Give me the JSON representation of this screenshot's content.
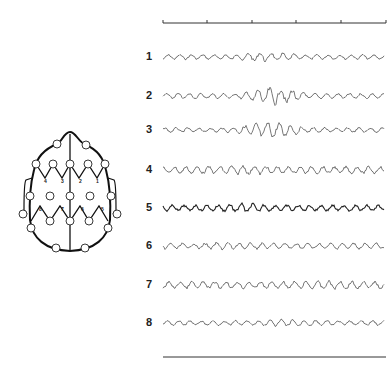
{
  "figure": {
    "type": "EEG recording diagram",
    "time_bar": {
      "x_start": 163,
      "x_end": 386,
      "y": 23,
      "ticks_x": [
        163,
        207,
        252,
        296,
        341,
        386
      ]
    },
    "bottom_bar": {
      "x_start": 163,
      "x_end": 386,
      "y": 357
    },
    "channels": [
      {
        "label": "1",
        "y": 57,
        "amp": 2.0,
        "burst": [
          230,
          300
        ],
        "burst_amp": 4.0
      },
      {
        "label": "2",
        "y": 96,
        "amp": 2.2,
        "burst": [
          240,
          310
        ],
        "burst_amp": 7.0
      },
      {
        "label": "3",
        "y": 130,
        "amp": 2.0,
        "burst": [
          235,
          305
        ],
        "burst_amp": 6.5
      },
      {
        "label": "4",
        "y": 170,
        "amp": 3.0,
        "burst": [
          220,
          280
        ],
        "burst_amp": 4.0
      },
      {
        "label": "5",
        "y": 208,
        "amp": 2.5,
        "burst": [
          220,
          270
        ],
        "burst_amp": 4.0
      },
      {
        "label": "6",
        "y": 246,
        "amp": 2.5,
        "burst": [
          200,
          260
        ],
        "burst_amp": 3.0
      },
      {
        "label": "7",
        "y": 285,
        "amp": 3.0,
        "burst": [
          290,
          380
        ],
        "burst_amp": 3.5
      },
      {
        "label": "8",
        "y": 323,
        "amp": 2.0,
        "burst": [
          260,
          320
        ],
        "burst_amp": 3.0
      }
    ],
    "head_map": {
      "electrode_labels_upper": [
        "4",
        "3",
        "2",
        "1"
      ],
      "electrode_labels_lower": [
        "8",
        "7",
        "6",
        "5"
      ]
    }
  }
}
